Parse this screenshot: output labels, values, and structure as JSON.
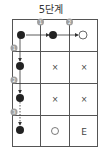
{
  "title": "5단계",
  "grid": {
    "rows": 4,
    "cols": 3,
    "cells": [
      [
        "black-stone",
        "black-stone",
        "white-stone"
      ],
      [
        "black-stone",
        "×",
        "×"
      ],
      [
        "black-stone",
        "×",
        "×"
      ],
      [
        "black-stone",
        "○",
        "E"
      ]
    ]
  },
  "top_badges": [
    "1",
    "2"
  ],
  "left_badges": [
    "1",
    "2",
    "3"
  ],
  "colors": {
    "line": "#555555",
    "stone": "#222222",
    "badge": "#a0a0a0",
    "badge_text": "#ffffff",
    "mark": "#444444"
  },
  "labels": {
    "x_mark": "×",
    "o_mark": "○",
    "end_mark": "E"
  }
}
